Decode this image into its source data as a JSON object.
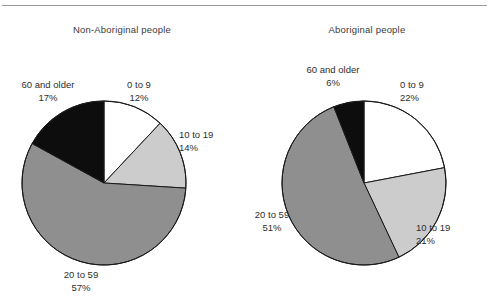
{
  "figure": {
    "background_color": "#ffffff",
    "rule_color": "#9a9a9a"
  },
  "chart_data": [
    {
      "type": "pie",
      "title": "Non-Aboriginal people",
      "categories": [
        "0 to 9",
        "10 to 19",
        "20 to 59",
        "60 and older"
      ],
      "values": [
        12,
        14,
        57,
        17
      ],
      "value_labels": [
        "12%",
        "14%",
        "57%",
        "17%"
      ],
      "colors": [
        "#ffffff",
        "#cccccc",
        "#8f8f8f",
        "#0d0d0d"
      ],
      "start_angle_deg": 0,
      "direction": "clockwise",
      "units": "percent",
      "legend": "none",
      "grid": false,
      "xlabel": "",
      "ylabel": ""
    },
    {
      "type": "pie",
      "title": "Aboriginal people",
      "categories": [
        "0 to 9",
        "10 to 19",
        "20 to 59",
        "60 and older"
      ],
      "values": [
        22,
        21,
        51,
        6
      ],
      "value_labels": [
        "22%",
        "21%",
        "51%",
        "6%"
      ],
      "colors": [
        "#ffffff",
        "#cccccc",
        "#8f8f8f",
        "#0d0d0d"
      ],
      "start_angle_deg": 0,
      "direction": "clockwise",
      "units": "percent",
      "legend": "none",
      "grid": false,
      "xlabel": "",
      "ylabel": ""
    }
  ],
  "panels": [
    {
      "id": "non-aboriginal",
      "title": "Non-Aboriginal people",
      "labels": {
        "age_0_9": {
          "name": "0 to 9",
          "pct": "12%"
        },
        "age_10_19": {
          "name": "10 to 19",
          "pct": "14%"
        },
        "age_20_59": {
          "name": "20 to 59",
          "pct": "57%"
        },
        "age_60_plus": {
          "name": "60 and older",
          "pct": "17%"
        }
      }
    },
    {
      "id": "aboriginal",
      "title": "Aboriginal people",
      "labels": {
        "age_0_9": {
          "name": "0 to 9",
          "pct": "22%"
        },
        "age_10_19": {
          "name": "10 to 19",
          "pct": "21%"
        },
        "age_20_59": {
          "name": "20 to 59",
          "pct": "51%"
        },
        "age_60_plus": {
          "name": "60 and older",
          "pct": "6%"
        }
      }
    }
  ]
}
